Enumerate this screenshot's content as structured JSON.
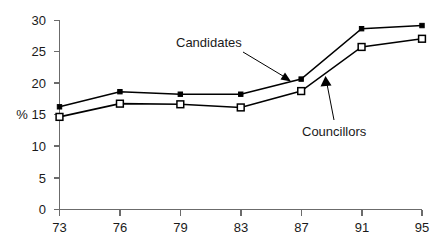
{
  "chart_data": {
    "type": "line",
    "title": "",
    "xlabel": "",
    "ylabel": "%",
    "x": [
      73,
      76,
      79,
      83,
      87,
      91,
      95
    ],
    "xtick_labels": [
      "73",
      "76",
      "79",
      "83",
      "87",
      "91",
      "95"
    ],
    "ytick_labels": [
      "0",
      "5",
      "10",
      "15",
      "20",
      "25",
      "30"
    ],
    "yticks": [
      0,
      5,
      10,
      15,
      20,
      25,
      30
    ],
    "ylim": [
      0,
      30
    ],
    "grid": false,
    "legend": "annotations",
    "series": [
      {
        "name": "Candidates",
        "marker": "filled-square",
        "values": [
          16.3,
          18.7,
          18.3,
          18.3,
          20.7,
          28.7,
          29.2
        ]
      },
      {
        "name": "Councillors",
        "marker": "open-square",
        "values": [
          14.7,
          16.8,
          16.7,
          16.2,
          18.8,
          25.8,
          27.1
        ]
      }
    ],
    "annotations": [
      {
        "text": "Candidates",
        "points_to_series": "Candidates",
        "points_to_x": 87
      },
      {
        "text": "Councillors",
        "points_to_series": "Councillors",
        "points_to_x": 87
      }
    ],
    "colors": {
      "line": "#000000",
      "axis": "#6b6b6b",
      "text": "#1a1a1a",
      "background": "#ffffff"
    }
  }
}
